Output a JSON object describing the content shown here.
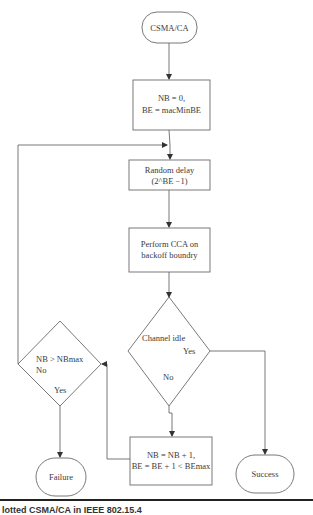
{
  "diagram": {
    "nodes": {
      "start": {
        "label": "CSMA/CA",
        "shape": "terminal"
      },
      "init": {
        "line1": "NB = 0,",
        "line2": "BE = macMinBE",
        "shape": "process"
      },
      "delay": {
        "line1": "Random delay",
        "line2": "(2^BE −1)",
        "shape": "process"
      },
      "cca": {
        "line1": "Perform CCA on",
        "line2": "backoff boundry",
        "shape": "process"
      },
      "channel_idle": {
        "label": "Channel idle",
        "yes": "Yes",
        "no": "No",
        "shape": "decision"
      },
      "nb_check": {
        "label": "NB > NBmax",
        "yes": "Yes",
        "no": "No",
        "shape": "decision"
      },
      "increment": {
        "line1": "NB = NB + 1,",
        "line2": "BE = BE + 1 < BEmax",
        "shape": "process"
      },
      "failure": {
        "label": "Failure",
        "shape": "terminal"
      },
      "success": {
        "label": "Success",
        "shape": "terminal"
      }
    },
    "edges": [
      {
        "from": "start",
        "to": "init"
      },
      {
        "from": "init",
        "to": "delay"
      },
      {
        "from": "delay",
        "to": "cca"
      },
      {
        "from": "cca",
        "to": "channel_idle"
      },
      {
        "from": "channel_idle",
        "to": "success",
        "label": "Yes"
      },
      {
        "from": "channel_idle",
        "to": "increment",
        "label": "No"
      },
      {
        "from": "increment",
        "to": "nb_check"
      },
      {
        "from": "nb_check",
        "to": "delay",
        "label": "No"
      },
      {
        "from": "nb_check",
        "to": "failure",
        "label": "Yes"
      }
    ]
  },
  "caption": "lotted CSMA/CA in IEEE 802.15.4",
  "colors": {
    "stroke": "#6a6a6a",
    "text": "#3a3a3a",
    "rule": "#222222"
  }
}
